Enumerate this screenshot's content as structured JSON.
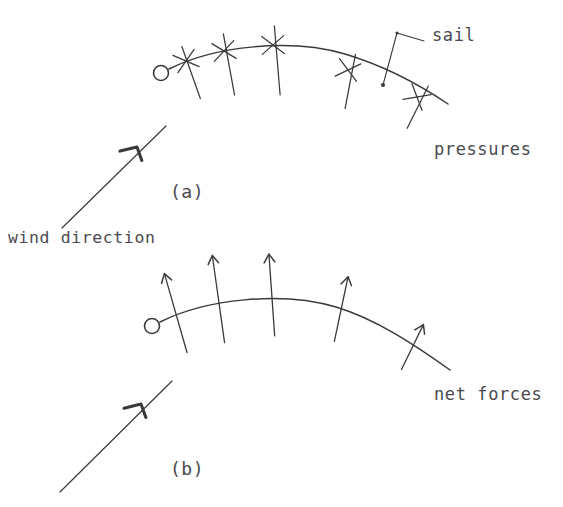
{
  "figure": {
    "background_color": "#ffffff",
    "ink_color": "#3a3a3e",
    "width": 563,
    "height": 507
  },
  "panel_a": {
    "id": "a",
    "label": "(a)",
    "label_x": 170,
    "label_y": 198,
    "sail_label": "sail",
    "sail_label_x": 432,
    "sail_label_y": 41,
    "pressures_label": "pressures",
    "pressures_label_x": 434,
    "pressures_label_y": 155,
    "wind_label": "wind direction",
    "wind_label_x": 8,
    "wind_label_y": 243,
    "mast": {
      "cx": 161,
      "cy": 73,
      "r": 7.5
    },
    "curve": "M 169 69 C 215 46, 290 38, 345 54 C 385 66, 420 85, 448 104",
    "leader": {
      "text_anchor_x": 424,
      "corner_x": 397,
      "corner_y": 33,
      "target_x": 383,
      "target_y": 85
    },
    "wind_arrow": {
      "x1": 62,
      "y1": 228,
      "x2": 166,
      "y2": 126,
      "head_x": 137,
      "head_y": 147
    },
    "pressure_markers": [
      {
        "x": 186,
        "y": 61,
        "angle": -16,
        "up": 15,
        "down": 40
      },
      {
        "x": 224,
        "y": 51,
        "angle": -8,
        "up": 17,
        "down": 45
      },
      {
        "x": 273,
        "y": 45,
        "angle": -2,
        "up": 19,
        "down": 50
      },
      {
        "x": 348,
        "y": 70,
        "angle": 14,
        "up": 17,
        "down": 38
      },
      {
        "x": 417,
        "y": 97,
        "angle": 30,
        "up": 15,
        "down": 32
      }
    ]
  },
  "panel_b": {
    "id": "b",
    "label": "(b)",
    "label_x": 170,
    "label_y": 475,
    "net_forces_label": "net forces",
    "net_forces_label_x": 434,
    "net_forces_label_y": 400,
    "mast": {
      "cx": 152,
      "cy": 326,
      "r": 7.5
    },
    "curve": "M 160 322 C 206 299, 281 291, 336 307 C 376 319, 415 345, 450 370",
    "wind_arrow": {
      "x1": 60,
      "y1": 492,
      "x2": 172,
      "y2": 381,
      "head_x": 141,
      "head_y": 404
    },
    "force_arrows": [
      {
        "x": 176,
        "y": 314,
        "angle": -16,
        "up": 42,
        "down": 40
      },
      {
        "x": 219,
        "y": 303,
        "angle": -8,
        "up": 48,
        "down": 40
      },
      {
        "x": 272,
        "y": 298,
        "angle": -4,
        "up": 44,
        "down": 38
      },
      {
        "x": 341,
        "y": 310,
        "angle": 12,
        "up": 34,
        "down": 32
      },
      {
        "x": 412,
        "y": 348,
        "angle": 26,
        "up": 26,
        "down": 24
      }
    ]
  }
}
